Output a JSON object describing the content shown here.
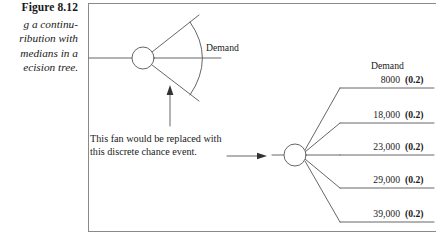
{
  "caption": {
    "title": "Figure 8.12",
    "lines": [
      "g a continu-",
      "ribution with",
      "medians in a",
      "ecision tree."
    ]
  },
  "figure": {
    "fan": {
      "node_icon": "chance-node-circle",
      "demand_label": "Demand",
      "pointer_icon": "up-arrow-icon"
    },
    "explanation": {
      "line1": "This fan would be replaced with",
      "line2": "this discrete chance event.",
      "arrow_icon": "right-arrow-icon"
    },
    "discrete": {
      "node_icon": "chance-node-circle",
      "header": "Demand",
      "branches": [
        {
          "value": "8000",
          "probability": "(0.2)"
        },
        {
          "value": "18,000",
          "probability": "(0.2)"
        },
        {
          "value": "23,000",
          "probability": "(0.2)"
        },
        {
          "value": "29,000",
          "probability": "(0.2)"
        },
        {
          "value": "39,000",
          "probability": "(0.2)"
        }
      ]
    }
  },
  "colors": {
    "ink": "#1a1a1a",
    "rule": "#8a8a8a",
    "line": "#555555",
    "background": "#ffffff"
  }
}
